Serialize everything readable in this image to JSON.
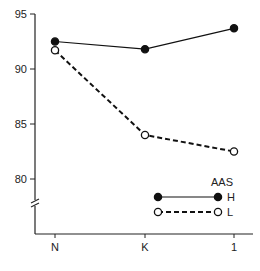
{
  "chart_data": {
    "type": "line",
    "title": "",
    "xlabel": "",
    "ylabel": "",
    "categories": [
      "N",
      "K",
      "1"
    ],
    "series": [
      {
        "name": "H",
        "marker": "filled-circle",
        "line": "solid",
        "values": [
          92.5,
          91.8,
          93.7
        ]
      },
      {
        "name": "L",
        "marker": "open-circle",
        "line": "dashed",
        "values": [
          91.7,
          84.0,
          82.5
        ]
      }
    ],
    "yticks": [
      80,
      85,
      90,
      95
    ],
    "ylim": [
      77,
      95
    ],
    "y_axis_break": true,
    "grid": false,
    "legend": {
      "title": "AAS",
      "position": "lower-right",
      "entries": [
        "H",
        "L"
      ]
    },
    "colors": {
      "line": "#111111",
      "axis": "#222222",
      "background": "#ffffff"
    }
  }
}
